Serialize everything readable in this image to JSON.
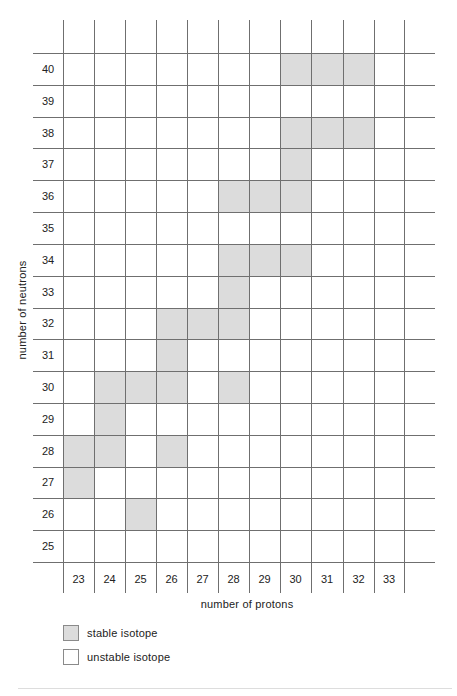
{
  "chart_data": {
    "type": "heatmap",
    "title": "",
    "xlabel": "number of protons",
    "ylabel": "number of neutrons",
    "x_categories": [
      23,
      24,
      25,
      26,
      27,
      28,
      29,
      30,
      31,
      32,
      33
    ],
    "y_categories": [
      40,
      39,
      38,
      37,
      36,
      35,
      34,
      33,
      32,
      31,
      30,
      29,
      28,
      27,
      26,
      25
    ],
    "grid": true,
    "legend_position": "bottom-left",
    "legend": [
      {
        "label": "stable isotope",
        "color": "#dcdcdc"
      },
      {
        "label": "unstable isotope",
        "color": "#ffffff"
      }
    ],
    "stable_isotopes": [
      {
        "protons": 30,
        "neutrons": 40
      },
      {
        "protons": 31,
        "neutrons": 40
      },
      {
        "protons": 32,
        "neutrons": 40
      },
      {
        "protons": 30,
        "neutrons": 38
      },
      {
        "protons": 31,
        "neutrons": 38
      },
      {
        "protons": 32,
        "neutrons": 38
      },
      {
        "protons": 30,
        "neutrons": 37
      },
      {
        "protons": 28,
        "neutrons": 36
      },
      {
        "protons": 29,
        "neutrons": 36
      },
      {
        "protons": 30,
        "neutrons": 36
      },
      {
        "protons": 28,
        "neutrons": 34
      },
      {
        "protons": 29,
        "neutrons": 34
      },
      {
        "protons": 30,
        "neutrons": 34
      },
      {
        "protons": 28,
        "neutrons": 33
      },
      {
        "protons": 26,
        "neutrons": 32
      },
      {
        "protons": 27,
        "neutrons": 32
      },
      {
        "protons": 28,
        "neutrons": 32
      },
      {
        "protons": 26,
        "neutrons": 31
      },
      {
        "protons": 24,
        "neutrons": 30
      },
      {
        "protons": 25,
        "neutrons": 30
      },
      {
        "protons": 26,
        "neutrons": 30
      },
      {
        "protons": 28,
        "neutrons": 30
      },
      {
        "protons": 24,
        "neutrons": 29
      },
      {
        "protons": 23,
        "neutrons": 28
      },
      {
        "protons": 24,
        "neutrons": 28
      },
      {
        "protons": 26,
        "neutrons": 28
      },
      {
        "protons": 23,
        "neutrons": 27
      },
      {
        "protons": 25,
        "neutrons": 26
      }
    ]
  },
  "axes": {
    "x_title": "number of protons",
    "y_title": "number of neutrons"
  },
  "legend": {
    "stable_label": "stable isotope",
    "unstable_label": "unstable isotope"
  },
  "colors": {
    "stable": "#dcdcdc",
    "unstable": "#ffffff",
    "grid": "#6f6f6f"
  }
}
